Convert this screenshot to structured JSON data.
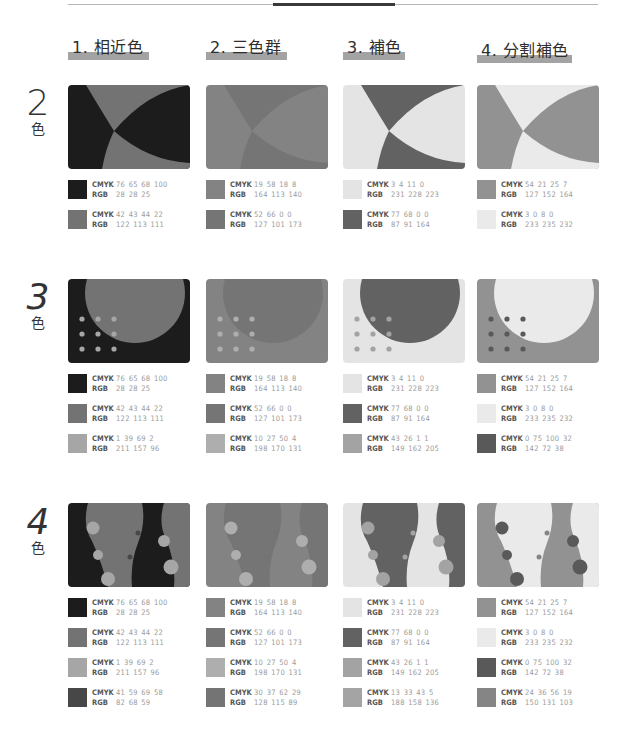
{
  "columns": [
    {
      "label": "1. 相近色",
      "key": "analogous"
    },
    {
      "label": "2. 三色群",
      "key": "triad"
    },
    {
      "label": "3. 補色",
      "key": "complementary"
    },
    {
      "label": "4. 分割補色",
      "key": "split_complementary"
    }
  ],
  "rows": [
    {
      "number": "2",
      "suffix": "色",
      "pattern": "arcs"
    },
    {
      "number": "3",
      "suffix": "色",
      "pattern": "circle-dots"
    },
    {
      "number": "4",
      "suffix": "色",
      "pattern": "vases"
    }
  ],
  "labels": {
    "cmyk": "CMYK",
    "rgb": "RGB"
  },
  "palettes": {
    "analogous": [
      {
        "cmyk": "76 65 68 100",
        "rgb": "28 28 25",
        "hex": "#1c1c19"
      },
      {
        "cmyk": "42 43 44 22",
        "rgb": "122 113 111",
        "hex": "#7a716f"
      },
      {
        "cmyk": "1 39 69 2",
        "rgb": "211 157 96",
        "hex": "#d39d60"
      },
      {
        "cmyk": "41 59 69 58",
        "rgb": "82 68 59",
        "hex": "#52443b"
      }
    ],
    "triad": [
      {
        "cmyk": "19 58 18 8",
        "rgb": "164 113 140",
        "hex": "#a4718c"
      },
      {
        "cmyk": "52 66 0 0",
        "rgb": "127 101 173",
        "hex": "#7f65ad"
      },
      {
        "cmyk": "10 27 50 4",
        "rgb": "198 170 131",
        "hex": "#c6aa83"
      },
      {
        "cmyk": "30 37 62 29",
        "rgb": "128 115 89",
        "hex": "#807359"
      }
    ],
    "complementary": [
      {
        "cmyk": "3 4 11 0",
        "rgb": "231 228 223",
        "hex": "#e7e4df"
      },
      {
        "cmyk": "77 68 0 0",
        "rgb": "87 91 164",
        "hex": "#575ba4"
      },
      {
        "cmyk": "43 26 1 1",
        "rgb": "149 162 205",
        "hex": "#95a2cd"
      },
      {
        "cmyk": "13 33 43 5",
        "rgb": "188 158 136",
        "hex": "#bc9e88"
      }
    ],
    "split_complementary": [
      {
        "cmyk": "54 21 25 7",
        "rgb": "127 152 164",
        "hex": "#7f98a4"
      },
      {
        "cmyk": "3 0 8 0",
        "rgb": "233 235 232",
        "hex": "#e9ebe8"
      },
      {
        "cmyk": "0 75 100 32",
        "rgb": "142 72 38",
        "hex": "#8e4826"
      },
      {
        "cmyk": "24 36 56 19",
        "rgb": "150 131 103",
        "hex": "#968367"
      }
    ]
  },
  "render_grayscale": true
}
